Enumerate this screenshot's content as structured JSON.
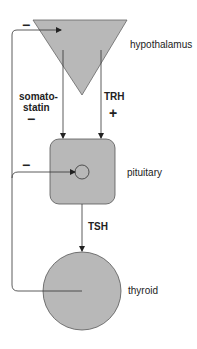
{
  "diagram": {
    "colors": {
      "organ_fill": "#b8b8b8",
      "organ_stroke": "#555555",
      "line": "#333333",
      "text": "#222222"
    },
    "nodes": [
      {
        "id": "hypothalamus",
        "label": "hypothalamus",
        "shape": "inverted-triangle"
      },
      {
        "id": "pituitary",
        "label": "pituitary",
        "shape": "rounded-square"
      },
      {
        "id": "thyroid",
        "label": "thyroid",
        "shape": "circle"
      }
    ],
    "edges": [
      {
        "from": "hypothalamus",
        "to": "pituitary",
        "label_line1": "somato-",
        "label_line2": "statin",
        "sign": "−"
      },
      {
        "from": "hypothalamus",
        "to": "pituitary",
        "label": "TRH",
        "sign": "+"
      },
      {
        "from": "pituitary",
        "to": "thyroid",
        "label": "TSH"
      },
      {
        "from": "thyroid",
        "to": "pituitary",
        "sign": "−",
        "type": "feedback"
      },
      {
        "from": "thyroid",
        "to": "hypothalamus",
        "sign": "−",
        "type": "feedback"
      }
    ]
  }
}
